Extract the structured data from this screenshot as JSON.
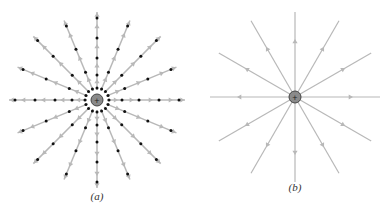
{
  "figure": {
    "panels": [
      {
        "id": "a",
        "caption": "(a)",
        "center": [
          97,
          100
        ],
        "line_count": 16,
        "description": "Positive point charge with radial field lines drawn as arrow vectors; dots mark evaluation points"
      },
      {
        "id": "b",
        "caption": "(b)",
        "center": [
          295,
          97
        ],
        "line_count": 12,
        "description": "Positive point charge with continuous radial field lines and direction arrows"
      }
    ],
    "charge_symbol": "+",
    "colors": {
      "line": "#b8b8b8",
      "dot": "#111111",
      "charge_fill": "#8a8a8a",
      "charge_stroke": "#444444"
    }
  }
}
